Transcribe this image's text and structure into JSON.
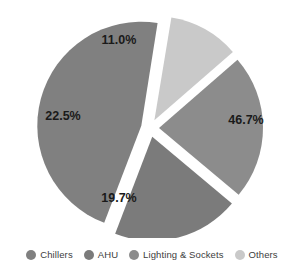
{
  "chart_data": {
    "type": "pie",
    "title": "",
    "categories": [
      "Chillers",
      "AHU",
      "Lighting & Sockets",
      "Others"
    ],
    "values": [
      46.7,
      19.7,
      22.5,
      11.0
    ],
    "labels": [
      "46.7%",
      "19.7%",
      "22.5%",
      "11.0%"
    ],
    "colors": [
      "#808080",
      "#7b7b7b",
      "#8c8c8c",
      "#c9c9c9"
    ],
    "unit": "%",
    "exploded": true,
    "grid": false,
    "legend_position": "bottom",
    "slices": [
      {
        "name": "Chillers",
        "value": 46.7,
        "label": "46.7%",
        "color": "#808080",
        "start_angle": 81.0,
        "end_angle": 249.1,
        "explode_angle": 165.0,
        "label_x": 246,
        "label_y": 121
      },
      {
        "name": "AHU",
        "value": 19.7,
        "label": "19.7%",
        "color": "#7b7b7b",
        "start_angle": 249.1,
        "end_angle": 320.0,
        "explode_angle": 284.5,
        "label_x": 119,
        "label_y": 199
      },
      {
        "name": "Lighting & Sockets",
        "value": 22.5,
        "label": "22.5%",
        "color": "#8c8c8c",
        "start_angle": 320.0,
        "end_angle": 41.0,
        "explode_angle": 0.5,
        "label_x": 63,
        "label_y": 117
      },
      {
        "name": "Others",
        "value": 11.0,
        "label": "11.0%",
        "color": "#c9c9c9",
        "start_angle": 41.0,
        "end_angle": 80.6,
        "explode_angle": 60.8,
        "label_x": 119,
        "label_y": 41
      }
    ]
  },
  "legend": {
    "items": [
      {
        "label": "Chillers",
        "color": "#808080"
      },
      {
        "label": "AHU",
        "color": "#7b7b7b"
      },
      {
        "label": "Lighting & Sockets",
        "color": "#8c8c8c"
      },
      {
        "label": "Others",
        "color": "#c9c9c9"
      }
    ]
  },
  "geometry": {
    "cx": 150,
    "cy": 128,
    "radius": 104,
    "explode_offset": 9
  }
}
